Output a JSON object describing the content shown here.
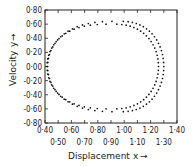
{
  "chart_data": {
    "type": "scatter",
    "title": "",
    "xlabel": "Displacement x",
    "ylabel": "Velocity y",
    "xlim": [
      0.4,
      1.4
    ],
    "ylim": [
      -0.8,
      0.8
    ],
    "grid": false,
    "legend": null,
    "x_ticks_upper": [
      "0·40",
      "0·60",
      "0·80",
      "1·00",
      "1·20",
      "1·40"
    ],
    "x_ticks_lower": [
      "0·50",
      "0·70",
      "0·90",
      "1·10",
      "1·30"
    ],
    "y_ticks": [
      "0·80",
      "0·60",
      "0·40",
      "0·20",
      "0·00",
      "-0·20",
      "-0·40",
      "-0·60",
      "-0·80"
    ],
    "series": [
      {
        "name": "inner orbit",
        "shape": "ellipse-like limit cycle",
        "x_min": 0.415,
        "x_max": 1.26,
        "y_min": -0.6,
        "y_max": 0.6,
        "peak_x": 0.92,
        "points": 70
      },
      {
        "name": "outer orbit",
        "shape": "ellipse-like limit cycle",
        "x_min": 0.42,
        "x_max": 1.3,
        "y_min": -0.64,
        "y_max": 0.64,
        "peak_x": 0.97,
        "points": 70
      }
    ]
  },
  "axes": {
    "x_title": "Displacement",
    "x_var": "x",
    "y_title": "Velocity",
    "y_var": "y",
    "arrow": "→"
  }
}
